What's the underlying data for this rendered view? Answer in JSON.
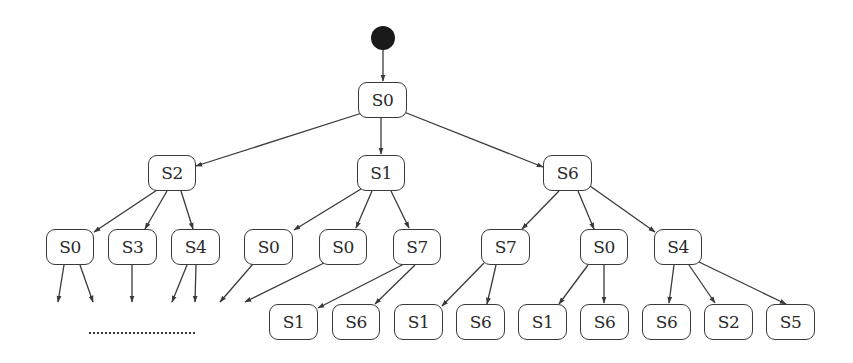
{
  "diagram": {
    "type": "state-transition-tree",
    "colors": {
      "stroke": "#3a3a3a",
      "fill": "#ffffff",
      "start": "#1a1a1a",
      "text": "#2a2a2a"
    },
    "start": {
      "cx": 383,
      "cy": 38,
      "r": 12
    },
    "nodes": [
      {
        "id": "n0",
        "label": "S0",
        "x": 358,
        "y": 82,
        "w": 49,
        "h": 36
      },
      {
        "id": "n1",
        "label": "S2",
        "x": 148,
        "y": 155,
        "w": 48,
        "h": 36
      },
      {
        "id": "n2",
        "label": "S1",
        "x": 357,
        "y": 155,
        "w": 48,
        "h": 36
      },
      {
        "id": "n3",
        "label": "S6",
        "x": 543,
        "y": 155,
        "w": 49,
        "h": 36
      },
      {
        "id": "n4",
        "label": "S0",
        "x": 46,
        "y": 229,
        "w": 48,
        "h": 36
      },
      {
        "id": "n5",
        "label": "S3",
        "x": 108,
        "y": 229,
        "w": 49,
        "h": 36
      },
      {
        "id": "n6",
        "label": "S4",
        "x": 171,
        "y": 229,
        "w": 49,
        "h": 36
      },
      {
        "id": "n7",
        "label": "S0",
        "x": 244,
        "y": 229,
        "w": 49,
        "h": 36
      },
      {
        "id": "n8",
        "label": "S0",
        "x": 319,
        "y": 229,
        "w": 48,
        "h": 36
      },
      {
        "id": "n9",
        "label": "S7",
        "x": 393,
        "y": 229,
        "w": 48,
        "h": 36
      },
      {
        "id": "n10",
        "label": "S7",
        "x": 481,
        "y": 229,
        "w": 49,
        "h": 36
      },
      {
        "id": "n11",
        "label": "S0",
        "x": 580,
        "y": 229,
        "w": 48,
        "h": 36
      },
      {
        "id": "n12",
        "label": "S4",
        "x": 654,
        "y": 229,
        "w": 48,
        "h": 36
      },
      {
        "id": "n13",
        "label": "S1",
        "x": 269,
        "y": 304,
        "w": 49,
        "h": 36
      },
      {
        "id": "n14",
        "label": "S6",
        "x": 332,
        "y": 304,
        "w": 48,
        "h": 36
      },
      {
        "id": "n15",
        "label": "S1",
        "x": 394,
        "y": 304,
        "w": 49,
        "h": 36
      },
      {
        "id": "n16",
        "label": "S6",
        "x": 456,
        "y": 304,
        "w": 49,
        "h": 36
      },
      {
        "id": "n17",
        "label": "S1",
        "x": 518,
        "y": 304,
        "w": 49,
        "h": 36
      },
      {
        "id": "n18",
        "label": "S6",
        "x": 580,
        "y": 304,
        "w": 49,
        "h": 36
      },
      {
        "id": "n19",
        "label": "S6",
        "x": 642,
        "y": 304,
        "w": 49,
        "h": 36
      },
      {
        "id": "n20",
        "label": "S2",
        "x": 704,
        "y": 304,
        "w": 49,
        "h": 36
      },
      {
        "id": "n21",
        "label": "S5",
        "x": 766,
        "y": 304,
        "w": 49,
        "h": 36
      }
    ],
    "edges": [
      {
        "from": [
          383,
          50
        ],
        "to": [
          383,
          81
        ]
      },
      {
        "from": [
          362,
          113
        ],
        "to": [
          196,
          166
        ]
      },
      {
        "from": [
          381,
          118
        ],
        "to": [
          381,
          154
        ]
      },
      {
        "from": [
          404,
          112
        ],
        "to": [
          543,
          167
        ]
      },
      {
        "from": [
          157,
          190
        ],
        "to": [
          94,
          232
        ]
      },
      {
        "from": [
          167,
          191
        ],
        "to": [
          145,
          229
        ]
      },
      {
        "from": [
          181,
          191
        ],
        "to": [
          193,
          229
        ]
      },
      {
        "from": [
          361,
          189
        ],
        "to": [
          294,
          230
        ]
      },
      {
        "from": [
          372,
          191
        ],
        "to": [
          356,
          228
        ]
      },
      {
        "from": [
          391,
          191
        ],
        "to": [
          409,
          228
        ]
      },
      {
        "from": [
          559,
          191
        ],
        "to": [
          522,
          229
        ]
      },
      {
        "from": [
          578,
          191
        ],
        "to": [
          594,
          229
        ]
      },
      {
        "from": [
          590,
          186
        ],
        "to": [
          655,
          232
        ]
      },
      {
        "from": [
          64,
          265
        ],
        "to": [
          58,
          302
        ]
      },
      {
        "from": [
          80,
          265
        ],
        "to": [
          93,
          302
        ]
      },
      {
        "from": [
          132,
          265
        ],
        "to": [
          132,
          302
        ]
      },
      {
        "from": [
          187,
          265
        ],
        "to": [
          172,
          302
        ]
      },
      {
        "from": [
          196,
          265
        ],
        "to": [
          195,
          302
        ]
      },
      {
        "from": [
          253,
          264
        ],
        "to": [
          220,
          302
        ]
      },
      {
        "from": [
          324,
          263
        ],
        "to": [
          245,
          302
        ]
      },
      {
        "from": [
          404,
          264
        ],
        "to": [
          318,
          308
        ]
      },
      {
        "from": [
          415,
          265
        ],
        "to": [
          375,
          304
        ]
      },
      {
        "from": [
          484,
          263
        ],
        "to": [
          442,
          306
        ]
      },
      {
        "from": [
          496,
          265
        ],
        "to": [
          487,
          304
        ]
      },
      {
        "from": [
          588,
          265
        ],
        "to": [
          559,
          304
        ]
      },
      {
        "from": [
          604,
          265
        ],
        "to": [
          604,
          303
        ]
      },
      {
        "from": [
          674,
          265
        ],
        "to": [
          669,
          303
        ]
      },
      {
        "from": [
          689,
          265
        ],
        "to": [
          715,
          303
        ]
      },
      {
        "from": [
          699,
          262
        ],
        "to": [
          786,
          304
        ]
      }
    ],
    "ellipsis": {
      "label": "……………………",
      "x": 89,
      "y": 332,
      "width": 106
    }
  }
}
